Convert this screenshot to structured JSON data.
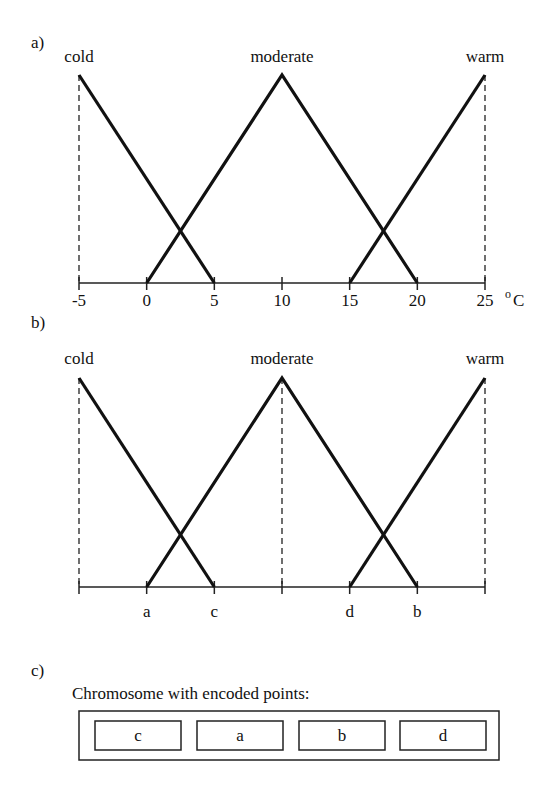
{
  "panel_a": {
    "label": "a)",
    "unit_label": "°C",
    "unit_sup": "o",
    "unit_letter": "C",
    "sets": [
      {
        "name": "cold",
        "points": [
          -5,
          -5,
          5
        ]
      },
      {
        "name": "moderate",
        "points": [
          0,
          10,
          20
        ]
      },
      {
        "name": "warm",
        "points": [
          15,
          25,
          25
        ]
      }
    ],
    "ticks": [
      -5,
      0,
      5,
      10,
      15,
      20,
      25
    ],
    "tick_labels": [
      "-5",
      "0",
      "5",
      "10",
      "15",
      "20",
      "25"
    ],
    "dashed_at": [
      -5,
      25
    ]
  },
  "panel_b": {
    "label": "b)",
    "sets": [
      {
        "name": "cold",
        "points": [
          -5,
          -5,
          5
        ]
      },
      {
        "name": "moderate",
        "points": [
          0,
          10,
          20
        ]
      },
      {
        "name": "warm",
        "points": [
          15,
          25,
          25
        ]
      }
    ],
    "ticks": [
      -5,
      0,
      5,
      10,
      15,
      20,
      25
    ],
    "tick_labels": [
      "",
      "a",
      "c",
      "",
      "d",
      "b",
      ""
    ],
    "dashed_at": [
      -5,
      10,
      25
    ]
  },
  "panel_c": {
    "label": "c)",
    "title": "Chromosome with encoded points:",
    "genes": [
      "c",
      "a",
      "b",
      "d"
    ]
  },
  "chart_data": [
    {
      "type": "line",
      "title": "a) Triangular membership functions",
      "xlabel": "°C",
      "ylabel": "",
      "xlim": [
        -5,
        25
      ],
      "ylim": [
        0,
        1
      ],
      "x_ticks": [
        -5,
        0,
        5,
        10,
        15,
        20,
        25
      ],
      "series": [
        {
          "name": "cold",
          "x": [
            -5,
            -5,
            5
          ],
          "y": [
            0,
            1,
            0
          ]
        },
        {
          "name": "moderate",
          "x": [
            0,
            10,
            20
          ],
          "y": [
            0,
            1,
            0
          ]
        },
        {
          "name": "warm",
          "x": [
            15,
            25,
            25
          ],
          "y": [
            0,
            1,
            0
          ]
        }
      ]
    },
    {
      "type": "line",
      "title": "b) Membership functions with encoded points",
      "xlim": [
        -5,
        25
      ],
      "ylim": [
        0,
        1
      ],
      "x_tick_labels": {
        "a": 0,
        "c": 5,
        "d": 15,
        "b": 20
      },
      "series": [
        {
          "name": "cold",
          "x": [
            -5,
            -5,
            5
          ],
          "y": [
            0,
            1,
            0
          ]
        },
        {
          "name": "moderate",
          "x": [
            0,
            10,
            20
          ],
          "y": [
            0,
            1,
            0
          ]
        },
        {
          "name": "warm",
          "x": [
            15,
            25,
            25
          ],
          "y": [
            0,
            1,
            0
          ]
        }
      ]
    }
  ]
}
